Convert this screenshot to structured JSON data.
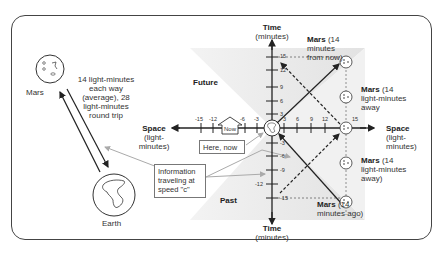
{
  "mars_label": "Mars",
  "earth_label": "Earth",
  "distance_note": {
    "line1": "14 light-minutes",
    "line2": "each way",
    "line3": "(average), 28",
    "line4": "light-minutes",
    "line5": "round trip"
  },
  "regions": {
    "future": "Future",
    "past": "Past"
  },
  "axes": {
    "time_top": {
      "title": "Time",
      "unit": "(minutes)"
    },
    "time_bottom": {
      "title": "Time",
      "unit": "(minutes)"
    },
    "space_left": {
      "title": "Space",
      "unit1": "(light-",
      "unit2": "minutes)"
    },
    "space_right": {
      "title": "Space",
      "unit1": "(light-",
      "unit2": "minutes)"
    }
  },
  "ticks": {
    "x_neg": [
      "-15",
      "-12",
      "-6",
      "-3"
    ],
    "x_pos": [
      "3",
      "6",
      "9",
      "12",
      "15"
    ],
    "y_pos": [
      "15",
      "12",
      "9",
      "6",
      "3"
    ],
    "y_neg": [
      "-3",
      "-6",
      "-9",
      "-12",
      "-15"
    ]
  },
  "now_marker": "Now",
  "here_now_box": "Here, now",
  "info_box": {
    "line1": "Information",
    "line2": "traveling at",
    "line3": "speed \"c\""
  },
  "mars_future": {
    "bold": "Mars",
    "rest1": " (14",
    "rest2": "minutes",
    "rest3": "from now)"
  },
  "mars_away_1": {
    "bold": "Mars",
    "rest1": " (14",
    "rest2": "light-minutes",
    "rest3": "away"
  },
  "mars_away_2": {
    "bold": "Mars",
    "rest1": " (14",
    "rest2": "light-minutes",
    "rest3": "away)"
  },
  "mars_past": {
    "bold": "Mars",
    "rest1": " (14",
    "rest2": "minutes ago)"
  },
  "colors": {
    "shade": "#e6e6e6",
    "line": "#333333",
    "arrow_light": "#aaaaaa"
  }
}
